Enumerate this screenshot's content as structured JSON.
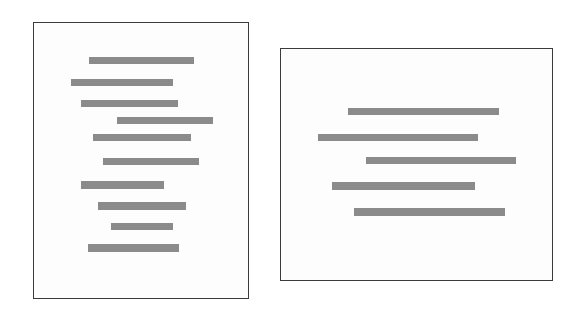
{
  "canvas": {
    "width": 579,
    "height": 315,
    "background_color": "#ffffff"
  },
  "style": {
    "panel_background": "#fdfdfd",
    "panel_border_color": "#3b3b3b",
    "panel_border_width": 1,
    "bar_color": "#8b8b8b"
  },
  "chart_data": {
    "type": "bar",
    "title": "",
    "xlabel": "",
    "ylabel": "",
    "grid": false,
    "legend": "none",
    "orientation": "horizontal",
    "panels": [
      {
        "name": "left-panel",
        "label": "",
        "x": 33,
        "y": 22,
        "width": 216,
        "height": 277,
        "bar_count": 10,
        "categories": [
          "1",
          "2",
          "3",
          "4",
          "5",
          "6",
          "7",
          "8",
          "9",
          "10"
        ],
        "values": [
          105,
          102,
          97,
          96,
          98,
          96,
          83,
          88,
          62,
          91
        ],
        "xlim": [
          0,
          216
        ],
        "bars": [
          {
            "index": 1,
            "left": 55,
            "top": 34,
            "width": 105,
            "height": 7
          },
          {
            "index": 2,
            "left": 37,
            "top": 56,
            "width": 102,
            "height": 7
          },
          {
            "index": 3,
            "left": 47,
            "top": 77,
            "width": 97,
            "height": 7
          },
          {
            "index": 4,
            "left": 83,
            "top": 94,
            "width": 96,
            "height": 7
          },
          {
            "index": 5,
            "left": 59,
            "top": 111,
            "width": 98,
            "height": 7
          },
          {
            "index": 6,
            "left": 69,
            "top": 135,
            "width": 96,
            "height": 7
          },
          {
            "index": 7,
            "left": 47,
            "top": 158,
            "width": 83,
            "height": 8
          },
          {
            "index": 8,
            "left": 64,
            "top": 179,
            "width": 88,
            "height": 8
          },
          {
            "index": 9,
            "left": 77,
            "top": 200,
            "width": 62,
            "height": 7
          },
          {
            "index": 10,
            "left": 54,
            "top": 221,
            "width": 91,
            "height": 8
          }
        ]
      },
      {
        "name": "right-panel",
        "label": "",
        "x": 280,
        "y": 48,
        "width": 273,
        "height": 233,
        "bar_count": 5,
        "categories": [
          "1",
          "2",
          "3",
          "4",
          "5"
        ],
        "values": [
          151,
          160,
          150,
          143,
          151
        ],
        "xlim": [
          0,
          273
        ],
        "bars": [
          {
            "index": 1,
            "left": 67,
            "top": 59,
            "width": 151,
            "height": 7
          },
          {
            "index": 2,
            "left": 37,
            "top": 85,
            "width": 160,
            "height": 7
          },
          {
            "index": 3,
            "left": 85,
            "top": 108,
            "width": 150,
            "height": 7
          },
          {
            "index": 4,
            "left": 51,
            "top": 133,
            "width": 143,
            "height": 8
          },
          {
            "index": 5,
            "left": 73,
            "top": 159,
            "width": 151,
            "height": 8
          }
        ]
      }
    ]
  }
}
